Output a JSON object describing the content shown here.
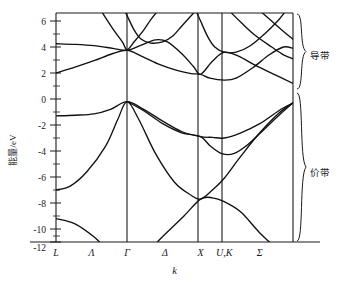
{
  "figure": {
    "title": "",
    "y_axis_label": "能量/eV",
    "x_axis_label": "k"
  },
  "annotations": {
    "conduction_band": "导带",
    "valence_band": "价带"
  },
  "chart_data": {
    "type": "line",
    "title": "",
    "subtitle": "",
    "xlabel": "k",
    "ylabel": "能量/eV",
    "ylim": [
      -13.2,
      6.8
    ],
    "xlim": [
      0,
      10
    ],
    "grid": false,
    "legend_position": "none",
    "y_ticks": [
      6,
      4,
      2,
      0,
      -2,
      -4,
      -6,
      -8,
      -10,
      -12
    ],
    "y_tick_labels": [
      "6",
      "4",
      "2",
      "0",
      "-2",
      "-4",
      "-6",
      "-8",
      "-10",
      "-12"
    ],
    "y_minor_tick_step": 1,
    "x_tick_labels": [
      "L",
      "Λ",
      "Γ",
      "Δ",
      "X",
      "U,K",
      "Σ"
    ],
    "high_symmetry_points": [
      {
        "label": "L",
        "x": 0.0,
        "vertical_line": false
      },
      {
        "label": "Λ",
        "x": 1.5,
        "vertical_line": false
      },
      {
        "label": "Γ",
        "x": 3.0,
        "vertical_line": true
      },
      {
        "label": "Δ",
        "x": 4.6,
        "vertical_line": false
      },
      {
        "label": "X",
        "x": 6.1,
        "vertical_line": true
      },
      {
        "label": "U,K",
        "x": 7.1,
        "vertical_line": true
      },
      {
        "label": "Σ",
        "x": 8.6,
        "vertical_line": false
      }
    ],
    "annotations": [
      {
        "text": "导带",
        "region": "conduction bands",
        "brace_energy_range": [
          1.2,
          6.8
        ]
      },
      {
        "text": "价带",
        "region": "valence bands",
        "brace_energy_range": [
          -12.1,
          -0.2
        ]
      }
    ],
    "series": [
      {
        "name": "valence band 1 (lowest)",
        "points": [
          [
            0.0,
            -9.2
          ],
          [
            0.8,
            -9.6
          ],
          [
            1.6,
            -10.6
          ],
          [
            2.3,
            -11.8
          ],
          [
            3.0,
            -12.5
          ],
          [
            3.8,
            -11.8
          ],
          [
            4.6,
            -10.4
          ],
          [
            5.4,
            -9.0
          ],
          [
            6.1,
            -7.7
          ],
          [
            6.6,
            -7.6
          ],
          [
            7.1,
            -7.9
          ],
          [
            7.8,
            -8.7
          ],
          [
            8.6,
            -10.3
          ],
          [
            9.4,
            -11.6
          ],
          [
            10.0,
            -12.1
          ]
        ]
      },
      {
        "name": "valence band 2",
        "points": [
          [
            0.0,
            -7.0
          ],
          [
            0.6,
            -6.7
          ],
          [
            1.3,
            -5.6
          ],
          [
            2.1,
            -3.6
          ],
          [
            2.6,
            -1.6
          ],
          [
            3.0,
            -0.2
          ],
          [
            3.5,
            -1.6
          ],
          [
            4.2,
            -4.2
          ],
          [
            5.0,
            -6.4
          ],
          [
            5.7,
            -7.4
          ],
          [
            6.1,
            -7.7
          ],
          [
            6.6,
            -7.0
          ],
          [
            7.1,
            -6.1
          ],
          [
            7.8,
            -4.4
          ],
          [
            8.6,
            -2.6
          ],
          [
            9.4,
            -1.1
          ],
          [
            10.0,
            -0.3
          ]
        ]
      },
      {
        "name": "valence band 3 (heavy hole)",
        "points": [
          [
            0.0,
            -1.3
          ],
          [
            0.8,
            -1.25
          ],
          [
            1.6,
            -1.15
          ],
          [
            2.3,
            -0.8
          ],
          [
            3.0,
            -0.2
          ],
          [
            3.7,
            -0.8
          ],
          [
            4.5,
            -1.7
          ],
          [
            5.3,
            -2.5
          ],
          [
            6.1,
            -2.9
          ],
          [
            6.6,
            -2.95
          ],
          [
            7.1,
            -3.0
          ],
          [
            7.8,
            -2.6
          ],
          [
            8.6,
            -1.9
          ],
          [
            9.4,
            -0.9
          ],
          [
            10.0,
            -0.3
          ]
        ]
      },
      {
        "name": "valence band 4 (light hole)",
        "points": [
          [
            3.0,
            -0.2
          ],
          [
            3.7,
            -0.9
          ],
          [
            4.5,
            -1.9
          ],
          [
            5.3,
            -2.6
          ],
          [
            6.1,
            -2.9
          ],
          [
            6.5,
            -3.6
          ],
          [
            7.0,
            -4.2
          ],
          [
            7.5,
            -4.2
          ],
          [
            8.1,
            -3.5
          ],
          [
            8.8,
            -2.3
          ],
          [
            9.5,
            -1.1
          ],
          [
            10.0,
            -0.3
          ]
        ]
      },
      {
        "name": "conduction band 1 (lowest)",
        "points": [
          [
            0.0,
            2.0
          ],
          [
            0.8,
            2.45
          ],
          [
            1.6,
            2.95
          ],
          [
            2.4,
            3.5
          ],
          [
            3.0,
            3.75
          ],
          [
            3.6,
            3.3
          ],
          [
            4.3,
            2.7
          ],
          [
            5.1,
            2.2
          ],
          [
            5.7,
            1.95
          ],
          [
            6.1,
            1.9
          ],
          [
            6.5,
            1.6
          ],
          [
            7.1,
            1.45
          ],
          [
            7.6,
            1.6
          ],
          [
            8.3,
            2.4
          ],
          [
            9.0,
            3.4
          ],
          [
            9.6,
            4.0
          ],
          [
            10.0,
            3.9
          ]
        ]
      },
      {
        "name": "conduction band 2",
        "points": [
          [
            0.0,
            4.25
          ],
          [
            0.8,
            4.2
          ],
          [
            1.6,
            4.1
          ],
          [
            2.4,
            3.9
          ],
          [
            3.0,
            3.75
          ],
          [
            3.6,
            4.15
          ],
          [
            4.2,
            4.55
          ],
          [
            4.7,
            4.4
          ],
          [
            5.3,
            3.5
          ],
          [
            5.8,
            2.5
          ],
          [
            6.1,
            1.9
          ],
          [
            6.6,
            2.9
          ],
          [
            7.1,
            3.6
          ],
          [
            7.7,
            3.3
          ],
          [
            8.4,
            2.6
          ],
          [
            9.2,
            1.9
          ],
          [
            10.0,
            1.2
          ]
        ]
      },
      {
        "name": "conduction band 3",
        "points": [
          [
            1.9,
            6.8
          ],
          [
            2.4,
            5.4
          ],
          [
            2.8,
            4.4
          ],
          [
            3.0,
            3.8
          ],
          [
            3.3,
            4.4
          ],
          [
            3.7,
            5.3
          ],
          [
            4.0,
            6.1
          ],
          [
            4.3,
            6.8
          ]
        ]
      },
      {
        "name": "conduction band 4",
        "points": [
          [
            2.9,
            6.8
          ],
          [
            3.3,
            5.3
          ],
          [
            3.6,
            4.6
          ],
          [
            4.0,
            4.3
          ],
          [
            4.5,
            4.4
          ],
          [
            4.9,
            4.8
          ],
          [
            5.3,
            5.6
          ],
          [
            5.7,
            6.4
          ],
          [
            5.9,
            6.8
          ]
        ]
      },
      {
        "name": "conduction band 5",
        "points": [
          [
            5.9,
            6.8
          ],
          [
            6.1,
            6.0
          ],
          [
            6.4,
            4.8
          ],
          [
            6.7,
            4.0
          ],
          [
            7.1,
            3.6
          ],
          [
            7.6,
            3.6
          ],
          [
            8.2,
            4.1
          ],
          [
            8.8,
            5.0
          ],
          [
            9.4,
            6.1
          ],
          [
            9.7,
            6.8
          ]
        ]
      },
      {
        "name": "conduction band 6",
        "points": [
          [
            7.3,
            6.8
          ],
          [
            7.8,
            5.9
          ],
          [
            8.4,
            4.9
          ],
          [
            9.1,
            4.0
          ],
          [
            9.6,
            3.4
          ],
          [
            10.0,
            3.1
          ]
        ]
      },
      {
        "name": "conduction band 7",
        "points": [
          [
            8.6,
            6.8
          ],
          [
            9.1,
            6.0
          ],
          [
            9.6,
            5.2
          ],
          [
            10.0,
            4.6
          ]
        ]
      }
    ]
  }
}
